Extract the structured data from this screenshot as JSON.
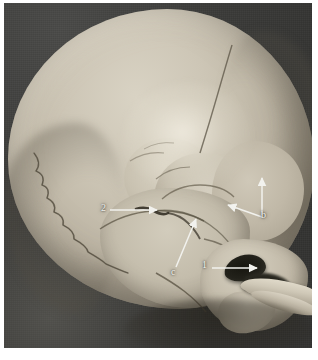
{
  "figure": {
    "kind": "anatomical-photograph",
    "region": "pterion and temporal region",
    "background_color": "#383836",
    "bone_color": "#c7c0af",
    "annotation_color": "#f2f2ee"
  },
  "annotations": [
    {
      "id": "label-2",
      "text": "2",
      "label_x": 101,
      "label_y": 205,
      "arrow": "horizontal-right",
      "points_to": "pterion-suture-junction"
    },
    {
      "id": "label-c",
      "text": "c",
      "label_x": 171,
      "label_y": 268,
      "arrow": "diagonal-up-right",
      "points_to": "squamous-suture"
    },
    {
      "id": "label-b",
      "text": "b",
      "label_x": 261,
      "label_y": 211,
      "arrow": "branched-up-and-upleft",
      "points_to": "coronal-suture-and-sphenoid-wing"
    },
    {
      "id": "label-1",
      "text": "1",
      "label_x": 202,
      "label_y": 261,
      "arrow": "horizontal-right",
      "points_to": "external-acoustic-meatus"
    }
  ]
}
